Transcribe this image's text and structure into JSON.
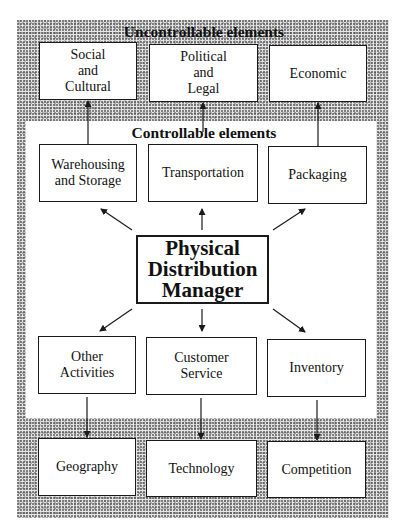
{
  "diagram": {
    "title_center": "Physical\nDistribution\nManager",
    "uncontrollable": {
      "label": "Uncontrollable elements",
      "top_boxes": [
        {
          "label": "Social\nand\nCultural"
        },
        {
          "label": "Political\nand\nLegal"
        },
        {
          "label": "Economic"
        }
      ],
      "bottom_boxes": [
        {
          "label": "Geography"
        },
        {
          "label": "Technology"
        },
        {
          "label": "Competition"
        }
      ]
    },
    "controllable": {
      "label": "Controllable elements",
      "top_boxes": [
        {
          "label": "Warehousing\nand Storage"
        },
        {
          "label": "Transportation"
        },
        {
          "label": "Packaging"
        }
      ],
      "bottom_boxes": [
        {
          "label": "Other\nActivities"
        },
        {
          "label": "Customer\nService"
        },
        {
          "label": "Inventory"
        }
      ]
    },
    "connections": [
      {
        "from": "Physical Distribution Manager",
        "to": "Warehousing and Storage"
      },
      {
        "from": "Physical Distribution Manager",
        "to": "Transportation"
      },
      {
        "from": "Physical Distribution Manager",
        "to": "Packaging"
      },
      {
        "from": "Physical Distribution Manager",
        "to": "Other Activities"
      },
      {
        "from": "Physical Distribution Manager",
        "to": "Customer Service"
      },
      {
        "from": "Physical Distribution Manager",
        "to": "Inventory"
      },
      {
        "from": "Warehousing and Storage",
        "to": "Social and Cultural"
      },
      {
        "from": "Transportation",
        "to": "Political and Legal"
      },
      {
        "from": "Packaging",
        "to": "Economic"
      },
      {
        "from": "Other Activities",
        "to": "Geography"
      },
      {
        "from": "Customer Service",
        "to": "Technology"
      },
      {
        "from": "Inventory",
        "to": "Competition"
      }
    ]
  }
}
